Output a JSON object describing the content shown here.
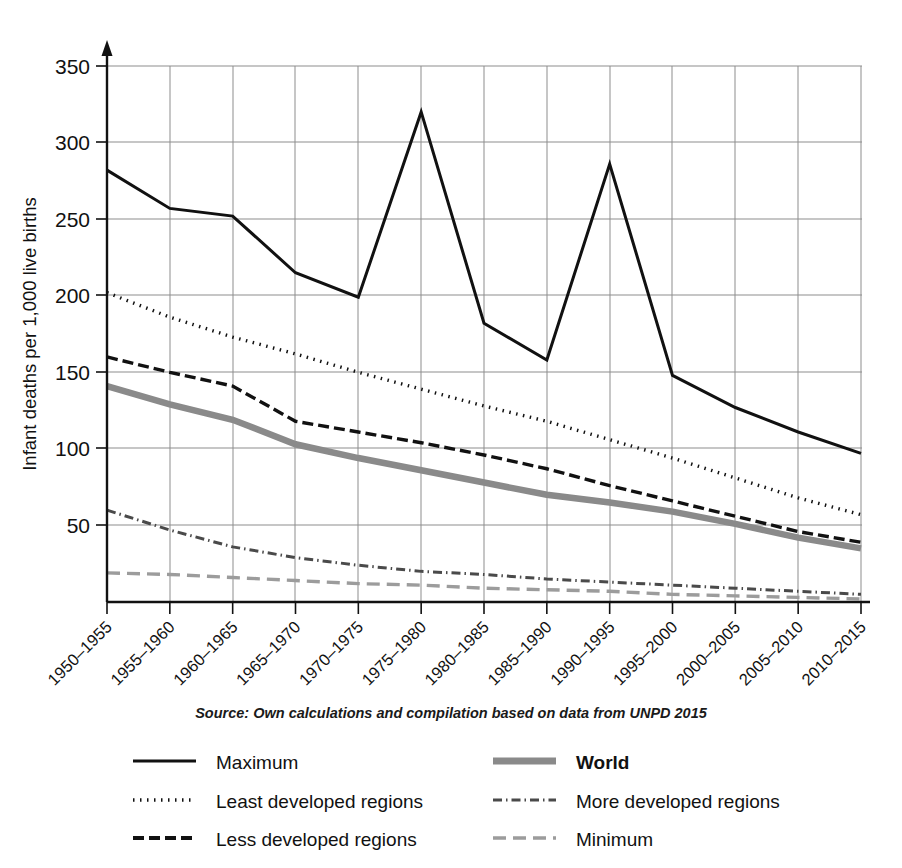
{
  "chart_data": {
    "type": "line",
    "title": "",
    "xlabel": "",
    "ylabel": "Infant deaths per 1,000 live births",
    "ylim": [
      0,
      350
    ],
    "yticks": [
      50,
      100,
      150,
      200,
      250,
      300,
      350
    ],
    "grid": true,
    "legend_position": "bottom",
    "source_note": "Source: Own calculations and compilation based on data from UNPD 2015",
    "categories": [
      "1950–1955",
      "1955–1960",
      "1960–1965",
      "1965–1970",
      "1970–1975",
      "1975–1980",
      "1980–1985",
      "1985–1990",
      "1990–1995",
      "1995–2000",
      "2000–2005",
      "2005–2010",
      "2010–2015"
    ],
    "series": [
      {
        "name": "Maximum",
        "style": "solid",
        "color": "#111111",
        "width": 3.0,
        "values": [
          282,
          257,
          252,
          215,
          199,
          320,
          182,
          158,
          286,
          148,
          127,
          111,
          97
        ]
      },
      {
        "name": "Least developed regions",
        "style": "dotted",
        "color": "#111111",
        "width": 3.4,
        "values": [
          202,
          186,
          173,
          162,
          150,
          139,
          128,
          118,
          106,
          94,
          81,
          68,
          57
        ]
      },
      {
        "name": "Less developed regions",
        "style": "dashed",
        "color": "#111111",
        "width": 3.4,
        "values": [
          160,
          150,
          141,
          118,
          111,
          104,
          96,
          87,
          76,
          66,
          56,
          46,
          39
        ]
      },
      {
        "name": "World",
        "style": "solid",
        "color": "#8a8a8a",
        "width": 6.5,
        "values": [
          141,
          129,
          119,
          103,
          94,
          86,
          78,
          70,
          65,
          59,
          51,
          42,
          35
        ]
      },
      {
        "name": "More developed regions",
        "style": "dashdot",
        "color": "#4a4a4a",
        "width": 3.0,
        "values": [
          60,
          47,
          36,
          29,
          24,
          20,
          18,
          15,
          13,
          11,
          9,
          7,
          5
        ]
      },
      {
        "name": "Minimum",
        "style": "longdash",
        "color": "#9c9c9c",
        "width": 3.4,
        "values": [
          19,
          18,
          16,
          14,
          12,
          11,
          9,
          8,
          7,
          5,
          4,
          3,
          2
        ]
      }
    ]
  },
  "legend": {
    "items": [
      {
        "label": "Maximum",
        "key": "maximum"
      },
      {
        "label": "World",
        "key": "world"
      },
      {
        "label": "Least developed regions",
        "key": "least-developed-regions"
      },
      {
        "label": "More developed regions",
        "key": "more-developed-regions"
      },
      {
        "label": "Less developed regions",
        "key": "less-developed-regions"
      },
      {
        "label": "Minimum",
        "key": "minimum"
      }
    ]
  }
}
